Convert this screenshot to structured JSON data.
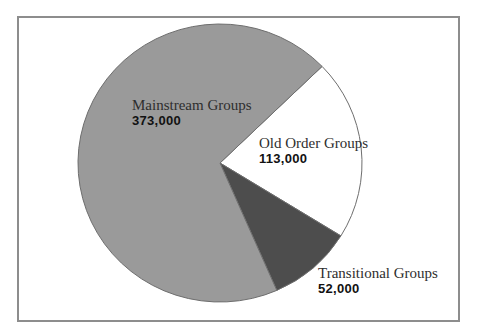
{
  "chart_data": {
    "type": "pie",
    "title": "",
    "slices": [
      {
        "id": "mainstream",
        "label": "Mainstream Groups",
        "value": 373000,
        "display_value": "373,000",
        "color": "#9a9a9a"
      },
      {
        "id": "old-order",
        "label": "Old Order Groups",
        "value": 113000,
        "display_value": "113,000",
        "color": "#ffffff"
      },
      {
        "id": "transitional",
        "label": "Transitional Groups",
        "value": 52000,
        "display_value": "52,000",
        "color": "#4d4d4d"
      }
    ],
    "layout": {
      "start_angle_deg": 44,
      "direction": "clockwise",
      "draw_order": [
        "old-order",
        "transitional",
        "mainstream"
      ],
      "outline_color": "#6e6e6e",
      "legend": "none",
      "labels": "adjacent-to-slices"
    }
  }
}
